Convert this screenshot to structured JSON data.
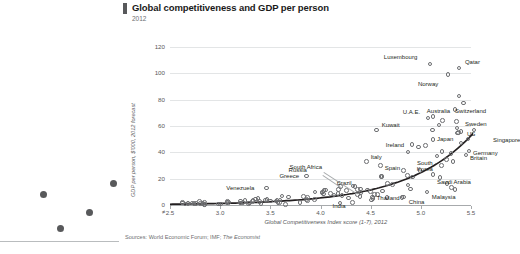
{
  "header": {
    "title": "Global competitiveness and GDP per person",
    "subtitle": "2012"
  },
  "source": {
    "prefix": "Sources: World Economic Forum; IMF;",
    "italic": "The Economist"
  },
  "left_panel": {
    "dots": [
      {
        "x": 43,
        "y": 194
      },
      {
        "x": 60,
        "y": 228
      },
      {
        "x": 89,
        "y": 212
      },
      {
        "x": 113,
        "y": 183
      }
    ],
    "dot_color": "#58595b"
  },
  "chart_data": {
    "type": "scatter",
    "title": "Global competitiveness and GDP per person",
    "subtitle": "2012",
    "xlabel": "Global Competitiveness Index score (1-7), 2012",
    "ylabel": "GDP per person, $'000, 2012 forecast",
    "xlim": [
      2.5,
      5.5
    ],
    "ylim": [
      0,
      120
    ],
    "xticks": [
      2.5,
      3.0,
      3.5,
      4.0,
      4.5,
      5.0,
      5.5
    ],
    "xtick_labels": [
      "2.5",
      "3.0",
      "3.5",
      "4.0",
      "4.5",
      "5.0",
      "5.5"
    ],
    "yticks": [
      0,
      20,
      40,
      60,
      80,
      100,
      120
    ],
    "ytick_labels": [
      "0",
      "20",
      "40",
      "60",
      "80",
      "100",
      "120"
    ],
    "axis_break": true,
    "grid": "horizontal",
    "marker": "open-circle",
    "trend": "exponential",
    "labeled_points": [
      {
        "name": "Luxembourg",
        "x": 5.09,
        "y": 107
      },
      {
        "name": "Qatar",
        "x": 5.38,
        "y": 104
      },
      {
        "name": "Norway",
        "x": 5.27,
        "y": 99
      },
      {
        "name": "Switzerland",
        "x": 5.72,
        "y": 79
      },
      {
        "name": "Australia",
        "x": 5.12,
        "y": 67
      },
      {
        "name": "U.A.E.",
        "x": 5.07,
        "y": 66
      },
      {
        "name": "Sweden",
        "x": 5.53,
        "y": 57
      },
      {
        "name": "Kuwait",
        "x": 4.56,
        "y": 57
      },
      {
        "name": "Japan",
        "x": 5.4,
        "y": 47
      },
      {
        "name": "US",
        "x": 5.47,
        "y": 50
      },
      {
        "name": "Singapore",
        "x": 5.67,
        "y": 51
      },
      {
        "name": "Ireland",
        "x": 4.91,
        "y": 46
      },
      {
        "name": "Germany",
        "x": 5.48,
        "y": 41
      },
      {
        "name": "Britain",
        "x": 5.45,
        "y": 38
      },
      {
        "name": "South Korea",
        "x": 5.12,
        "y": 23
      },
      {
        "name": "Saudi Arabia",
        "x": 5.19,
        "y": 21
      },
      {
        "name": "Italy",
        "x": 4.46,
        "y": 33
      },
      {
        "name": "Spain",
        "x": 4.6,
        "y": 30
      },
      {
        "name": "Brazil",
        "x": 4.4,
        "y": 12
      },
      {
        "name": "South Africa",
        "x": 4.37,
        "y": 8
      },
      {
        "name": "Russia",
        "x": 4.2,
        "y": 14
      },
      {
        "name": "Greece",
        "x": 3.86,
        "y": 22
      },
      {
        "name": "Venezuela",
        "x": 3.46,
        "y": 13
      },
      {
        "name": "Thailand",
        "x": 4.52,
        "y": 6
      },
      {
        "name": "Malaysia",
        "x": 5.06,
        "y": 10
      },
      {
        "name": "India",
        "x": 4.32,
        "y": 2
      },
      {
        "name": "China",
        "x": 4.83,
        "y": 6
      }
    ],
    "unlabeled_count": 110
  }
}
